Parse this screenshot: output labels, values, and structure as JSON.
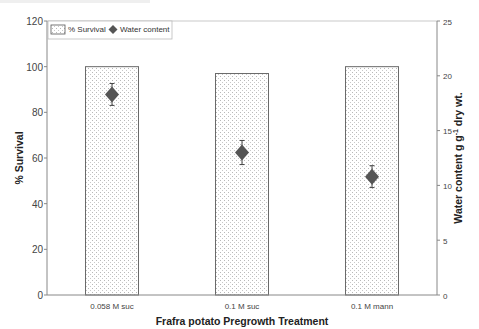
{
  "chart_data": {
    "type": "bar",
    "title": "",
    "xlabel": "Frafra potato Pregrowth Treatment",
    "ylabel": "% Survival",
    "y2label": "Water content g g-1 dry wt.",
    "categories": [
      "0.058 M suc",
      "0.1 M suc",
      "0.1 M mann"
    ],
    "series": [
      {
        "name": "% Survival",
        "type": "bar",
        "axis": "left",
        "values": [
          100,
          97,
          100
        ]
      },
      {
        "name": "Water content",
        "type": "scatter",
        "marker": "diamond",
        "axis": "right",
        "values": [
          18.3,
          13.0,
          10.8
        ],
        "error": [
          1.0,
          1.1,
          1.0
        ]
      }
    ],
    "ylim": [
      0,
      120
    ],
    "y2lim": [
      0,
      25
    ],
    "yticks": [
      0,
      20,
      40,
      60,
      80,
      100,
      120
    ],
    "y2ticks": [
      0,
      5,
      10,
      15,
      20,
      25
    ],
    "grid": false,
    "legend_position": "top-left inside"
  },
  "labels": {
    "xlabel": "Frafra potato Pregrowth Treatment",
    "ylabel": "% Survival",
    "y2label_main": "Water content g g",
    "y2label_sup": "-1",
    "y2label_end": " dry wt.",
    "legend_bar": "% Survival",
    "legend_marker": "Water content"
  },
  "colors": {
    "bar_fill": "#ffffff",
    "bar_dots": "#b8b8b8",
    "bar_border": "#6a6a6a",
    "marker": "#555555",
    "axis": "#888888"
  }
}
